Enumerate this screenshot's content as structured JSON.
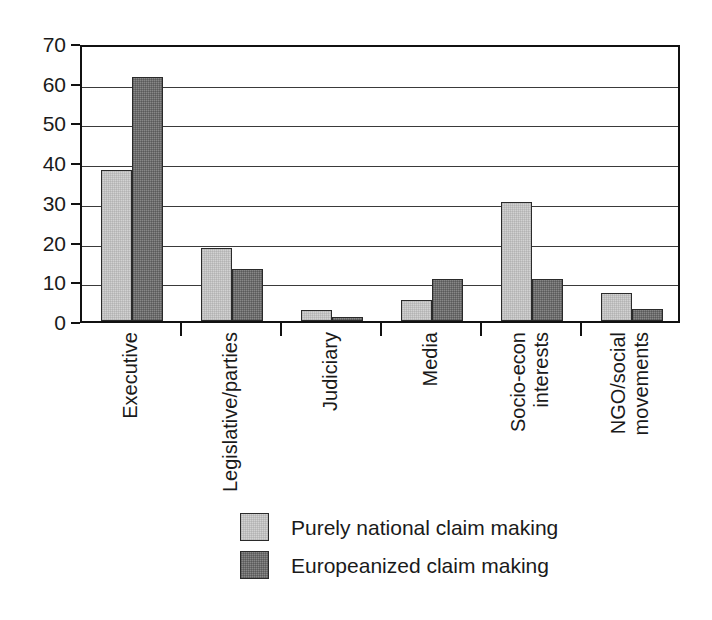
{
  "chart_data": {
    "type": "bar",
    "title": "",
    "subtitle": "",
    "xlabel": "",
    "ylabel": "",
    "ylim": [
      0,
      70
    ],
    "ytick_step": 10,
    "yticks": [
      0,
      10,
      20,
      30,
      40,
      50,
      60,
      70
    ],
    "ytick_labels": [
      "0",
      "10",
      "20",
      "30",
      "40",
      "50",
      "60",
      "70"
    ],
    "grid": "horizontal",
    "legend_position": "bottom-center",
    "categories": [
      "Executive",
      "Legislative/parties",
      "Judiciary",
      "Media",
      "Socio-econ interests",
      "NGO/social movements"
    ],
    "category_lines": [
      [
        "Executive"
      ],
      [
        "Legislative/parties"
      ],
      [
        "Judiciary"
      ],
      [
        "Media"
      ],
      [
        "Socio-econ",
        "interests"
      ],
      [
        "NGO/social",
        "movements"
      ]
    ],
    "series": [
      {
        "name": "Purely national claim making",
        "color": "#d2d2d2",
        "values": [
          38,
          18.3,
          2.8,
          5.2,
          30,
          7
        ]
      },
      {
        "name": "Europeanized claim making",
        "color": "#888888",
        "values": [
          61.5,
          13,
          1,
          10.6,
          10.6,
          3
        ]
      }
    ]
  },
  "legend": {
    "items": [
      {
        "label": "Purely national claim making",
        "swatch": "light-gray-swatch"
      },
      {
        "label": "Europeanized claim making",
        "swatch": "dark-gray-swatch"
      }
    ]
  }
}
